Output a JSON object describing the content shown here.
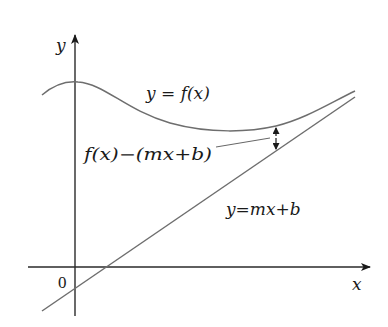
{
  "diagram": {
    "type": "function-with-slant-asymptote",
    "axes": {
      "x_label": "x",
      "y_label": "y",
      "origin_label": "0"
    },
    "curves": [
      {
        "name": "f",
        "label": "y = f(x)"
      },
      {
        "name": "asymptote",
        "label": "y=mx+b"
      }
    ],
    "annotation": {
      "label": "f(x)−(mx+b)",
      "description": "vertical distance between curve and line"
    },
    "colors": {
      "axis": "#2a2a2a",
      "curve": "#6e6e6e",
      "text": "#1a1a1a"
    }
  }
}
